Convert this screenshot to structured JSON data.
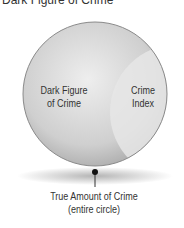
{
  "title": "Dark Figure of Crime",
  "diagram": {
    "regions": [
      {
        "name": "dark-figure",
        "label_line1": "Dark Figure",
        "label_line2": "of Crime"
      },
      {
        "name": "crime-index",
        "label_line1": "Crime",
        "label_line2": "Index"
      }
    ],
    "callout": {
      "line1": "True Amount of Crime",
      "line2": "(entire circle)"
    },
    "colors": {
      "circle": "#c8c8c8",
      "crescent": "#e4e4e4",
      "outline": "#888888",
      "text": "#333333"
    }
  }
}
